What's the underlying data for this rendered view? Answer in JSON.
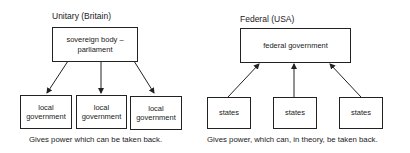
{
  "unitary": {
    "title": "Unitary (Britain)",
    "top_box": {
      "line1": "sovereign body –",
      "line2": "parliament"
    },
    "bottom_boxes": [
      {
        "line1": "local",
        "line2": "government"
      },
      {
        "line1": "local",
        "line2": "government"
      },
      {
        "line1": "local",
        "line2": "government"
      }
    ],
    "arrow_direction": "down",
    "caption": "Gives power which can be taken back."
  },
  "federal": {
    "title": "Federal (USA)",
    "top_box": {
      "label": "federal government"
    },
    "bottom_boxes": [
      {
        "label": "states"
      },
      {
        "label": "states"
      },
      {
        "label": "states"
      }
    ],
    "arrow_direction": "up",
    "caption": "Gives power, which can, in theory, be taken back."
  }
}
